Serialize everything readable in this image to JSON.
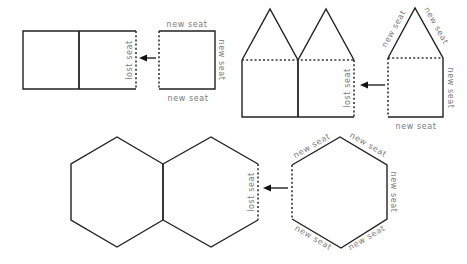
{
  "diagram": {
    "labels": {
      "lost_seat": "lost seat",
      "new_seat": "new seat"
    },
    "colors": {
      "line": "#222222",
      "label": "#7a7a7a",
      "background": "#ffffff"
    },
    "rows": [
      {
        "shape": "square",
        "joined_pair": {
          "lost_seat_label": "lost seat"
        },
        "single": {
          "new_seat_labels": [
            "new seat",
            "new seat",
            "new seat"
          ]
        }
      },
      {
        "shape": "pentagon",
        "joined_pair": {
          "lost_seat_label": "lost seat"
        },
        "single": {
          "new_seat_labels": [
            "new seat",
            "new seat",
            "new seat",
            "new seat"
          ]
        }
      },
      {
        "shape": "hexagon",
        "joined_pair": {
          "lost_seat_label": "lost seat"
        },
        "single": {
          "new_seat_labels": [
            "new seat",
            "new seat",
            "new seat",
            "new seat",
            "new seat"
          ]
        }
      }
    ]
  }
}
